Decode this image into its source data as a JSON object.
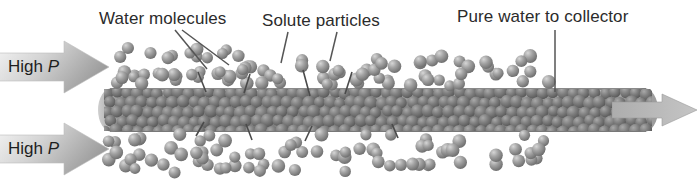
{
  "figure": {
    "background_color": "#ffffff",
    "width": 699,
    "height": 194
  },
  "labels": {
    "water_molecules": "Water molecules",
    "solute_particles": "Solute particles",
    "pure_water": "Pure water to collector",
    "high_pressure_top": "High P",
    "high_pressure_bottom": "High P",
    "high_pressure_prefix": "High ",
    "pressure_symbol": "P"
  },
  "colors": {
    "text": "#2b2b2b",
    "arrow_light": "#efefef",
    "arrow_dark": "#9a9a9a",
    "tube_light": "#d8d8d8",
    "tube_dark": "#6f6f6f",
    "sphere_light": "#c9c9c9",
    "sphere_dark": "#6b6b6b",
    "sphere_inner_dark": "#5a5a5a",
    "leader_line": "#555555"
  },
  "chart_data": {
    "type": "diagram",
    "elements": [
      {
        "name": "pressure-arrow-top",
        "label": "High P",
        "direction": "right"
      },
      {
        "name": "pressure-arrow-bottom",
        "label": "High P",
        "direction": "right"
      },
      {
        "name": "membrane-tube",
        "x": 98,
        "y": 88,
        "width": 560,
        "height": 44
      },
      {
        "name": "outflow-arrow",
        "label": "Pure water to collector",
        "direction": "right"
      }
    ],
    "leader_lines": [
      {
        "from": "Water molecules",
        "to_x": 206,
        "to_y": 68
      },
      {
        "from": "Water molecules",
        "to_x": 228,
        "to_y": 66
      },
      {
        "from": "Solute particles",
        "to_x": 283,
        "to_y": 62
      },
      {
        "from": "Solute particles",
        "to_x": 330,
        "to_y": 60
      },
      {
        "from": "Pure water to collector",
        "to_x": 555,
        "to_y": 88
      }
    ],
    "sphere_fields": [
      {
        "name": "top-feed-water",
        "region": "above tube",
        "count": 70
      },
      {
        "name": "bottom-feed-water",
        "region": "below tube",
        "count": 64
      },
      {
        "name": "tube-interior",
        "region": "inside membrane tube",
        "count": 190
      }
    ]
  }
}
